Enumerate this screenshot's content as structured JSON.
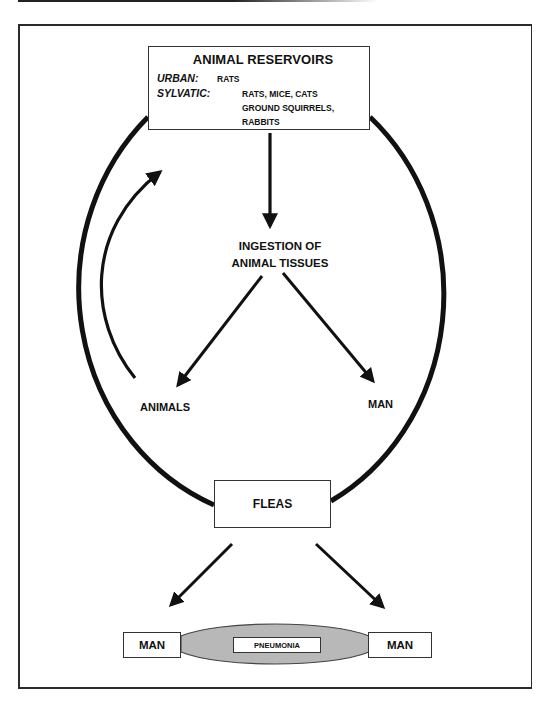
{
  "diagram": {
    "reservoirs": {
      "title": "ANIMAL RESERVOIRS",
      "urban_label": "URBAN:",
      "urban_value": "RATS",
      "sylvatic_label": "SYLVATIC:",
      "sylvatic_line1": "RATS, MICE, CATS",
      "sylvatic_line2": "GROUND SQUIRRELS,",
      "sylvatic_line3": "RABBITS"
    },
    "ingestion_line1": "INGESTION OF",
    "ingestion_line2": "ANIMAL TISSUES",
    "animals": "ANIMALS",
    "man_middle": "MAN",
    "fleas": "FLEAS",
    "man_left": "MAN",
    "pneumonia": "PNEUMONIA",
    "man_right": "MAN",
    "colors": {
      "stroke": "#111111",
      "pneumonia_fill": "#b8b8b8"
    }
  }
}
